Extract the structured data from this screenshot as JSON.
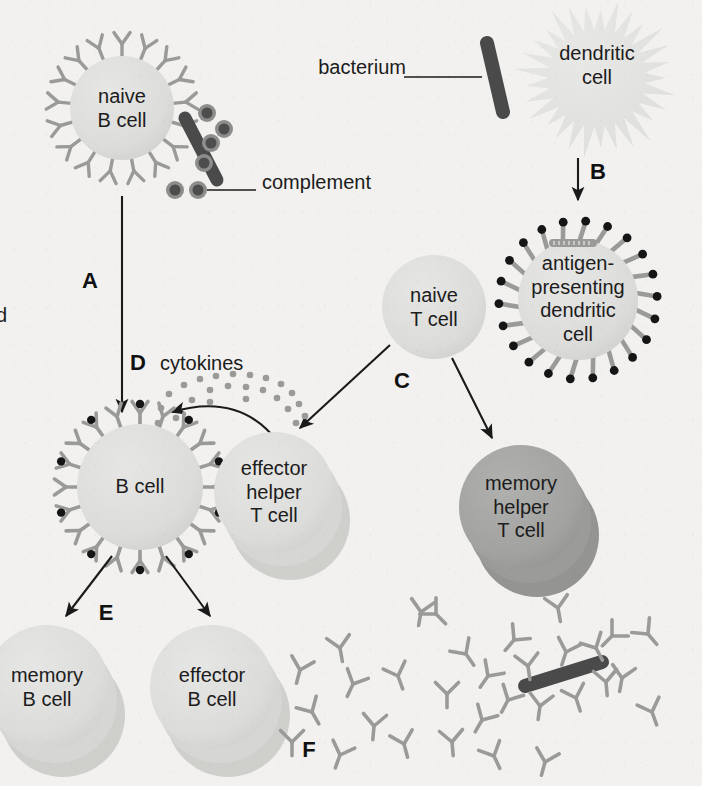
{
  "figure": {
    "background_color": "#f2f1ef",
    "cell_fill": "#dcdcda",
    "cell_fill_dark": "#a2a2a0",
    "receptor_color": "#9a9a98",
    "antigen_dot_color": "#151515",
    "bacterium_color": "#4a4a4a",
    "complement_color": "#5a5a5a",
    "line_color": "#1a1a1a"
  },
  "cells": {
    "naive_b": {
      "label": "naive\nB cell",
      "x": 122,
      "y": 108,
      "r": 52
    },
    "dendritic": {
      "label": "dendritic\ncell",
      "x": 597,
      "y": 78,
      "r": 62
    },
    "apc": {
      "label": "antigen-\npresenting\ndendritic\ncell",
      "x": 578,
      "y": 300,
      "r": 60
    },
    "naive_t": {
      "label": "naive\nT cell",
      "x": 434,
      "y": 307,
      "r": 52
    },
    "activated_b": {
      "label": "B cell",
      "x": 140,
      "y": 487,
      "r": 63
    },
    "effector_helper_t": {
      "label": "effector\nhelper\nT cell",
      "x": 274,
      "y": 492,
      "r": 60
    },
    "memory_helper_t": {
      "label": "memory\nhelper\nT cell",
      "x": 521,
      "y": 507,
      "r": 62
    },
    "memory_b": {
      "label": "memory\nB cell",
      "x": 47,
      "y": 687,
      "r": 62
    },
    "effector_b": {
      "label": "effector\nB cell",
      "x": 212,
      "y": 687,
      "r": 62
    }
  },
  "callouts": {
    "bacterium": {
      "text": "bacterium",
      "x": 336,
      "y": 67
    },
    "complement": {
      "text": "complement",
      "x": 263,
      "y": 182
    },
    "cytokines": {
      "text": "cytokines",
      "x": 168,
      "y": 363
    }
  },
  "steps": [
    {
      "id": "A",
      "label": "A",
      "x": 88,
      "y": 281
    },
    {
      "id": "B",
      "label": "B",
      "x": 596,
      "y": 172
    },
    {
      "id": "C",
      "label": "C",
      "x": 400,
      "y": 381
    },
    {
      "id": "D",
      "label": "D",
      "x": 136,
      "y": 363
    },
    {
      "id": "E",
      "label": "E",
      "x": 104,
      "y": 613
    },
    {
      "id": "F",
      "label": "F",
      "x": 307,
      "y": 750
    }
  ],
  "clipped_text": {
    "text": "d",
    "x": 0,
    "y": 316
  },
  "antibody_field": {
    "count": 31,
    "bacterium_coated": true,
    "note": "secreted antibodies binding bacterium"
  }
}
